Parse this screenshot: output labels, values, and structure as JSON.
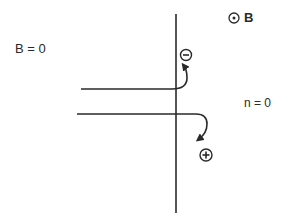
{
  "diagram": {
    "labels": {
      "field_free_region": "B = 0",
      "field_region_symbol": "⊙",
      "field_region": "B",
      "density_zero": "n = 0"
    },
    "charges": {
      "negative": "−",
      "positive": "+"
    },
    "colors": {
      "line": "#2a2a2a",
      "background": "#ffffff"
    },
    "geometry": {
      "boundary_x": 176,
      "boundary_top": 14,
      "boundary_bottom": 213,
      "upper_track_y": 89,
      "upper_track_start_x": 81,
      "lower_track_y": 114,
      "lower_track_start_x": 77
    }
  }
}
